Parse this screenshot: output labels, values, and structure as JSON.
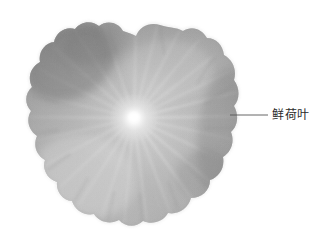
{
  "figure": {
    "type": "specimen-photograph",
    "background_color": "#ffffff",
    "rendering": "grayscale"
  },
  "annotation": {
    "label_text": "鲜荷叶",
    "leader_line": {
      "start_x": 230,
      "start_y": 115,
      "end_x": 268,
      "end_y": 115,
      "color": "#555555"
    },
    "label_x": 272,
    "label_y": 115,
    "text_color": "#2b2b2b"
  },
  "specimen": {
    "center_x": 134,
    "center_y": 118,
    "bounds": {
      "left": 26,
      "top": 24,
      "right": 239,
      "bottom": 223
    },
    "vein_count": 26,
    "center_hub_color": "#f2f2f2",
    "vein_color": "#d8d8d8",
    "body_color_light": "#bcbcbc",
    "body_color_mid": "#a2a2a2",
    "body_color_dark": "#7e7e7e",
    "edge_shadow_color": "#6e6e6e",
    "outline_color": "#8a8a8a",
    "lobe_count": 14,
    "top_notch_x": 136,
    "top_notch_depth": 12
  }
}
